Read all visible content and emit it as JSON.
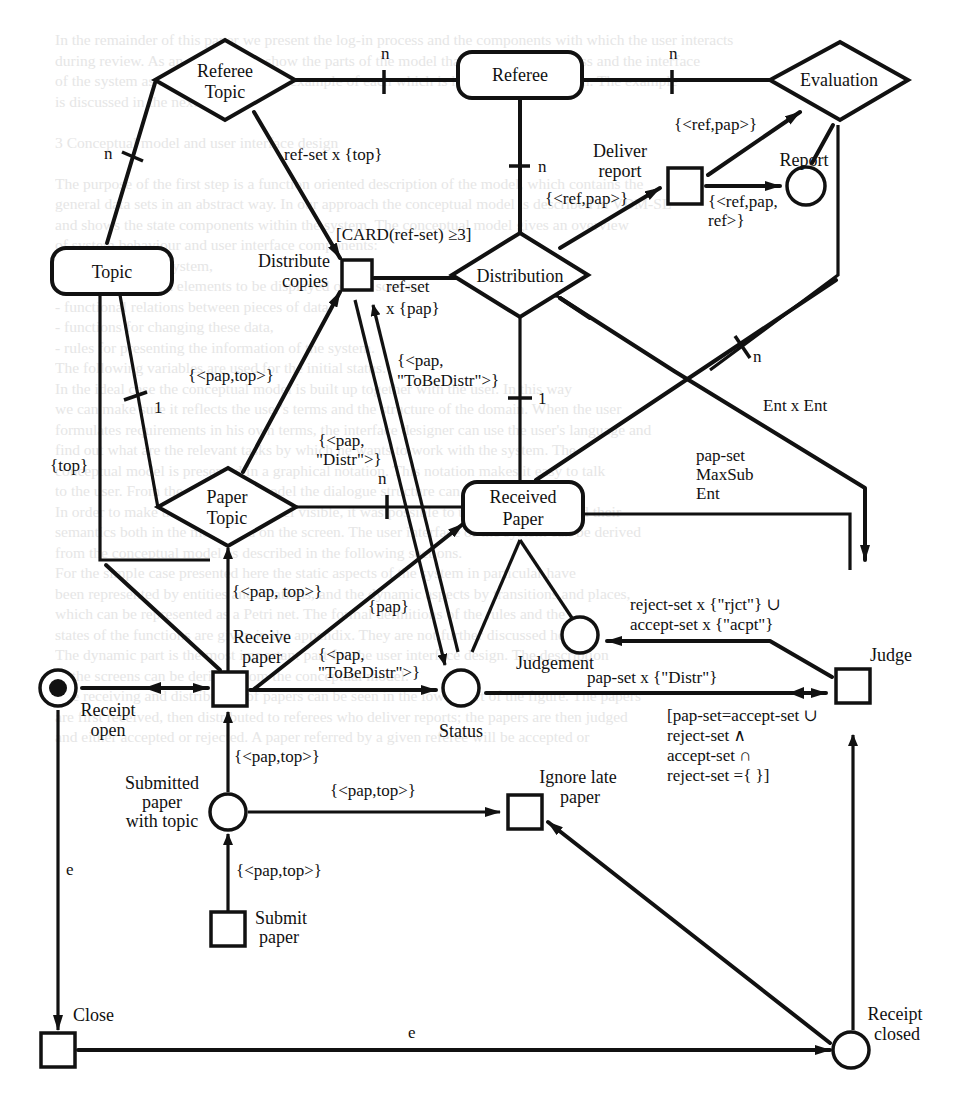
{
  "figure": {
    "type": "Petri net / entity-relationship conference review process diagram",
    "background_text_lines": [
      "In the remainder of this paper we present the log-in process and the components with which the user interacts",
      "during review. As an example we show the parts of the model that describe the process and the interface",
      "of the system as a whole, and give an example of each which is handled by the system. The example",
      "is discussed in the next section.",
      "",
      "3   Conceptual model and user interface design",
      "",
      "The purpose of the first step is a function oriented description of the model, which contains the",
      "general data sets in an abstract way. In our approach the conceptual model is described in VDM-SL",
      "and shows the state components within the system. The conceptual model gives an overview",
      "of system behaviour and user interface components:",
      "  - boundary of the system,",
      "  - relations between elements to be displayed on the screen,",
      "  - functional relations between pieces of data,",
      "  - functions for changing these data,",
      "  - rules for presenting the information of the system.",
      "  The following variables are used for the initial status.",
      "  In the ideal case the conceptual model is built up together with the user. In this way",
      "we can make sure it reflects the user's terms and the structure of the domain. When the user",
      "formulates requirements in his own terms, the interface designer can use the user's language and",
      "find out what are the relevant tasks by which he wants to work with the system. The",
      "conceptual model is presented in a graphical notation. This notation makes it easy to talk",
      "to the user. From the conceptual model the dialogue structure can be derived.",
      "  In order to make the conceptual model visible, it was possible to use the notations and their",
      "semantics both in the model and on the screen. The user interface of the system can be derived",
      "from the conceptual model as described in the following sections.",
      "  For the simple case presented here the static aspects of the system in particular have",
      "been represented by entities and relations, and the dynamic aspects by transitions and places,",
      "which can be represented as a Petri net. The formal definitions of the rules and the",
      "states of the functions are given in the appendix. They are not further discussed here.",
      "  The dynamic part is the most important part for the user interface design. The description",
      "of the screens can be derived from the conceptual model.",
      "  The receiving and distribution of papers can be seen in the lower part of the figure. The papers",
      "are first received, then distributed to referees who deliver reports; the papers are then judged",
      "and either accepted or rejected. A paper referred by a given referee will be accepted or"
    ],
    "entities": [
      {
        "id": "topic",
        "label": "Topic",
        "shape": "rounded-rect"
      },
      {
        "id": "referee",
        "label": "Referee",
        "shape": "rounded-rect"
      },
      {
        "id": "received-paper",
        "label_lines": [
          "Received",
          "Paper"
        ],
        "shape": "rounded-rect"
      }
    ],
    "relations": [
      {
        "id": "referee-topic",
        "label_lines": [
          "Referee",
          "Topic"
        ],
        "shape": "diamond"
      },
      {
        "id": "evaluation",
        "label": "Evaluation",
        "shape": "diamond"
      },
      {
        "id": "distribution",
        "label": "Distribution",
        "shape": "diamond"
      },
      {
        "id": "paper-topic",
        "label_lines": [
          "Paper",
          "Topic"
        ],
        "shape": "diamond"
      }
    ],
    "transitions": [
      {
        "id": "distribute-copies",
        "label_lines": [
          "Distribute",
          "copies"
        ]
      },
      {
        "id": "deliver-report",
        "label_lines": [
          "Deliver",
          "report"
        ]
      },
      {
        "id": "receive-paper",
        "label_lines": [
          "Receive",
          "paper"
        ]
      },
      {
        "id": "judge",
        "label": "Judge"
      },
      {
        "id": "ignore-late-paper",
        "label_lines": [
          "Ignore late",
          "paper"
        ]
      },
      {
        "id": "submit-paper",
        "label_lines": [
          "Submit",
          "paper"
        ]
      },
      {
        "id": "close",
        "label": "Close"
      }
    ],
    "places": [
      {
        "id": "report",
        "label": "Report"
      },
      {
        "id": "status",
        "label": "Status"
      },
      {
        "id": "judgement",
        "label": "Judgement"
      },
      {
        "id": "receipt-open",
        "label_lines": [
          "Receipt",
          "open"
        ],
        "marked": true
      },
      {
        "id": "submitted-paper",
        "label_lines": [
          "Submitted",
          "paper",
          "with topic"
        ]
      },
      {
        "id": "receipt-closed",
        "label_lines": [
          "Receipt",
          "closed"
        ]
      }
    ],
    "cardinalities": {
      "referee_topic_to_referee": "n",
      "referee_to_evaluation": "n",
      "topic_to_referee_topic": "n",
      "referee_to_distribution": "n",
      "topic_to_paper_topic": "1",
      "distribution_to_received_paper": "1",
      "paper_topic_to_received_paper": "n",
      "received_paper_to_evaluation": "n"
    },
    "arc_labels": {
      "ref_set_top": "ref-set x {top}",
      "card_guard": "[CARD(ref-set) ≥3]",
      "ref_set_pap_1": "ref-set",
      "ref_set_pap_2": "x {pap}",
      "ref_pap_eval": "{<ref,pap>}",
      "ref_pap_deliver": "{<ref,pap>}",
      "ref_pap_ref_1": "{<ref,pap,",
      "ref_pap_ref_2": "ref>}",
      "pap_top_distribute": "{<pap,top>}",
      "pap_tobedistr_1_a": "{<pap,",
      "pap_tobedistr_1_b": "\"ToBeDistr\">}",
      "pap_distr_1": "{<pap,",
      "pap_distr_2": "\"Distr\">}",
      "top": "{top}",
      "ent_x_ent": "Ent x Ent",
      "pap_set_1": "pap-set",
      "pap_set_2": "MaxSub",
      "pap_set_3": "Ent",
      "pap_top_receive": "{<pap, top>}",
      "pap": "{pap}",
      "pap_tobedistr_2_a": "{<pap,",
      "pap_tobedistr_2_b": "\"ToBeDistr\">}",
      "reject_1": "reject-set x {\"rjct\"} ∪",
      "reject_2": "accept-set x {\"acpt\"}",
      "pap_set_distr": "pap-set x {\"Distr\"}",
      "judge_guard_1": "[pap-set=accept-set ∪",
      "judge_guard_2": "reject-set ∧",
      "judge_guard_3": "accept-set ∩",
      "judge_guard_4": "reject-set ={ }]",
      "pap_top_submitted": "{<pap,top>}",
      "pap_top_ignore": "{<pap,top>}",
      "pap_top_submit": "{<pap,top>}",
      "e_close": "e",
      "e_receipt_closed": "e"
    }
  }
}
